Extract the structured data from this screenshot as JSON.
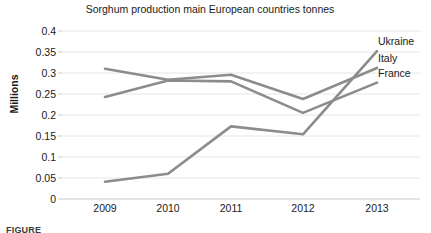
{
  "chart_data": {
    "type": "line",
    "title": "Sorghum production main European countries tonnes",
    "xlabel": "",
    "ylabel": "Millions",
    "categories": [
      "2009",
      "2010",
      "2011",
      "2012",
      "2013"
    ],
    "x": [
      2009,
      2010,
      2011,
      2012,
      2013
    ],
    "series": [
      {
        "name": "Ukraine",
        "color": "#8c8c8c",
        "values": [
          0.041,
          0.06,
          0.173,
          0.154,
          0.352
        ]
      },
      {
        "name": "Italy",
        "color": "#8c8c8c",
        "values": [
          0.31,
          0.284,
          0.296,
          0.238,
          0.312
        ]
      },
      {
        "name": "France",
        "color": "#8c8c8c",
        "values": [
          0.243,
          0.282,
          0.28,
          0.205,
          0.277
        ]
      }
    ],
    "ylim": [
      0,
      0.4
    ],
    "yticks": [
      "0",
      "0.05",
      "0.1",
      "0.15",
      "0.2",
      "0.25",
      "0.3",
      "0.35",
      "0.4"
    ],
    "ytick_values": [
      0,
      0.05,
      0.1,
      0.15,
      0.2,
      0.25,
      0.3,
      0.35,
      0.4
    ],
    "grid": true,
    "grid_axis": "y",
    "legend_position": "right-inline",
    "line_color": "#8c8c8c",
    "grid_color": "#e6e6e6",
    "axis_color": "#d9d9d9"
  },
  "caption": {
    "text": "FIGURE"
  }
}
